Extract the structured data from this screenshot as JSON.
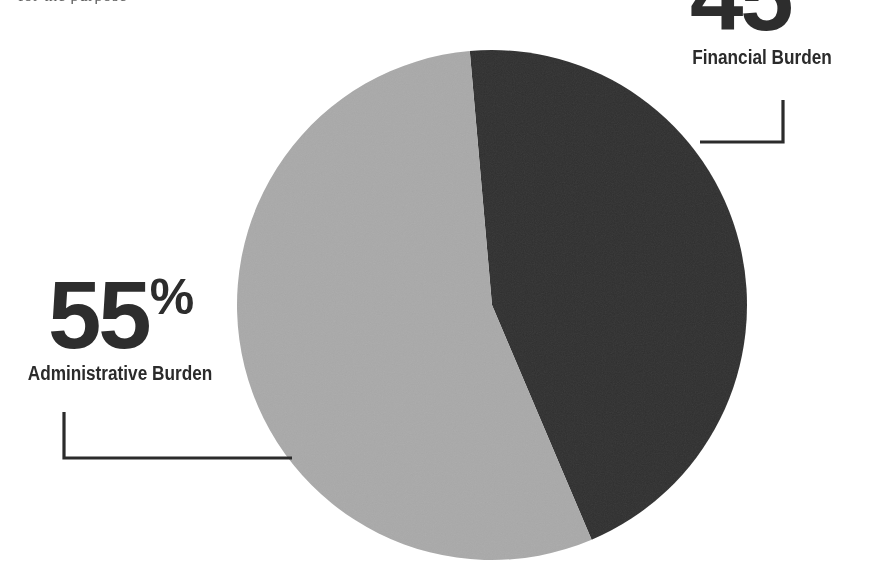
{
  "page": {
    "width": 887,
    "height": 569,
    "background": "#ffffff",
    "clipped_header_text": "for the purpose"
  },
  "colors": {
    "slice_dark": "#2f2f2f",
    "slice_light": "#a9a9a9",
    "text": "#2b2b2b",
    "leader_line": "#2b2b2b",
    "background": "#ffffff"
  },
  "callouts": [
    {
      "id": "financial",
      "value": "45",
      "symbol": "%",
      "label": "Financial Burden",
      "position": "top-right"
    },
    {
      "id": "administrative",
      "value": "55",
      "symbol": "%",
      "label": "Administrative Burden",
      "position": "mid-left"
    }
  ],
  "chart_data": {
    "type": "pie",
    "title": "",
    "subtitle": "",
    "xlabel": "",
    "ylabel": "",
    "legend_position": "callout-labels",
    "grid": false,
    "units": "percent",
    "start_angle_deg": 355,
    "direction": "clockwise",
    "center": {
      "x": 492,
      "y": 305
    },
    "radius": 255,
    "categories": [
      "Financial Burden",
      "Administrative Burden"
    ],
    "values": [
      45,
      55
    ],
    "labels": [
      "45%",
      "55%"
    ],
    "slice_colors": [
      "#2f2f2f",
      "#a9a9a9"
    ],
    "series": [
      {
        "name": "Burden share",
        "values": [
          45,
          55
        ]
      }
    ],
    "annotations": [
      {
        "text": "45%",
        "for": "Financial Burden"
      },
      {
        "text": "Financial Burden",
        "for": "Financial Burden"
      },
      {
        "text": "55%",
        "for": "Administrative Burden"
      },
      {
        "text": "Administrative Burden",
        "for": "Administrative Burden"
      }
    ]
  }
}
